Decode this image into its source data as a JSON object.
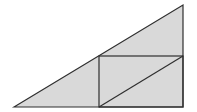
{
  "diagram": {
    "colors": {
      "fill": "#d9d9d9",
      "stroke": "#2f2f2f",
      "background": "#ffffff"
    },
    "triangle": {
      "points": "14,107 183,5 183,107"
    },
    "rectangle": {
      "x": 99,
      "y": 56,
      "width": 84,
      "height": 51
    },
    "diagonal": {
      "x1": 99,
      "y1": 107,
      "x2": 183,
      "y2": 56
    }
  }
}
